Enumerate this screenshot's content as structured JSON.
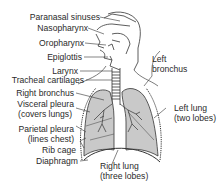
{
  "diagram": {
    "colors": {
      "lung_fill": "#c9c9c9",
      "line": "#333333",
      "background": "#ffffff"
    },
    "labels_left": [
      {
        "id": "paranasal",
        "text": "Paranasal sinuses"
      },
      {
        "id": "nasopharynx",
        "text": "Nasopharynx"
      },
      {
        "id": "oropharynx",
        "text": "Oropharynx"
      },
      {
        "id": "epiglottis",
        "text": "Epiglottis"
      },
      {
        "id": "larynx",
        "text": "Larynx"
      },
      {
        "id": "tracheal",
        "text": "Tracheal cartilages"
      },
      {
        "id": "right_bronchus",
        "text": "Right bronchus"
      },
      {
        "id": "visceral_1",
        "text": "Visceral pleura"
      },
      {
        "id": "visceral_2",
        "text": "(covers lungs)"
      },
      {
        "id": "parietal_1",
        "text": "Parietal pleura"
      },
      {
        "id": "parietal_2",
        "text": "(lines chest)"
      },
      {
        "id": "rib_cage",
        "text": "Rib cage"
      },
      {
        "id": "diaphragm",
        "text": "Diaphragm"
      }
    ],
    "labels_right": [
      {
        "id": "left_bronchus_1",
        "text": "Left"
      },
      {
        "id": "left_bronchus_2",
        "text": "bronchus"
      },
      {
        "id": "left_lung_1",
        "text": "Left lung"
      },
      {
        "id": "left_lung_2",
        "text": "(two lobes)"
      },
      {
        "id": "right_lung_1",
        "text": "Right lung"
      },
      {
        "id": "right_lung_2",
        "text": "(three lobes)"
      }
    ]
  }
}
